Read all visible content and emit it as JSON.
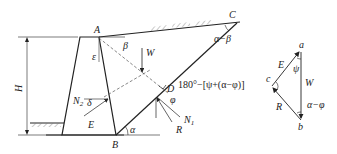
{
  "diagram": {
    "points": {
      "A": "A",
      "B": "B",
      "C": "C",
      "D": "D"
    },
    "angles": {
      "beta": "β",
      "epsilon": "ε",
      "delta": "δ",
      "alpha": "α",
      "phi": "φ",
      "alpha_minus_beta": "α−β"
    },
    "forces": {
      "W": "W",
      "E": "E",
      "R": "R",
      "N": "N",
      "N1_sub": "1",
      "N2_sub": "2"
    },
    "dimension": {
      "height_label": "H"
    },
    "force_triangle": {
      "vertex_a": "a",
      "vertex_b": "b",
      "vertex_c": "c",
      "side_E": "E",
      "side_W": "W",
      "side_R": "R",
      "angle_psi": "ψ",
      "angle_alpha_minus_phi": "α−φ",
      "angle_c_expression": "180°−[ψ+(α−φ)]"
    },
    "colors": {
      "line": "#222222",
      "dashed": "#555555",
      "hatch": "#777777"
    }
  }
}
